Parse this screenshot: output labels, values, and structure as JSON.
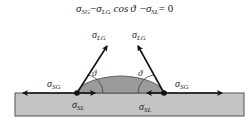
{
  "diagram": {
    "equation": {
      "sigma": "σ",
      "sub_sg": "SG",
      "minus1": "−",
      "sub_lg": "LG",
      "cos": "cos",
      "theta": "ϑ",
      "minus2": "−",
      "sub_sl": "SL",
      "equals": "= 0"
    },
    "labels": {
      "sigma": "σ",
      "lg": "LG",
      "sg": "SG",
      "sl": "SL",
      "theta": "ϑ"
    },
    "colors": {
      "substrate_fill": "#c4c4c4",
      "substrate_stroke": "#555555",
      "droplet_fill": "#9a9a9a",
      "arrow": "#111111"
    }
  }
}
